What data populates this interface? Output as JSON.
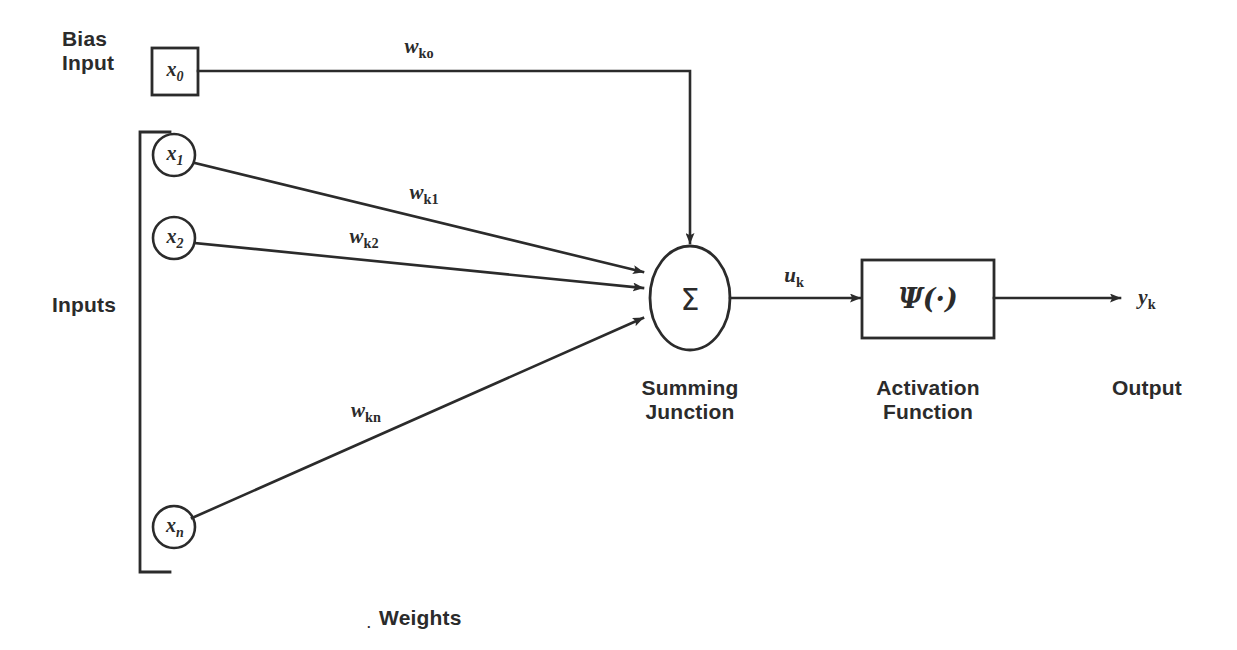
{
  "diagram": {
    "colors": {
      "ink": "#2b2b2b",
      "background": "#ffffff"
    },
    "bias": {
      "label_line1": "Bias",
      "label_line2": "Input",
      "node_symbol": "x",
      "node_subscript": "0",
      "weight_symbol": "w",
      "weight_subscript": "ko"
    },
    "inputs_label": "Inputs",
    "weights_label": "Weights",
    "weights_marker": ".",
    "nodes": [
      {
        "symbol": "x",
        "subscript": "1",
        "weight_symbol": "w",
        "weight_subscript": "k1"
      },
      {
        "symbol": "x",
        "subscript": "2",
        "weight_symbol": "w",
        "weight_subscript": "k2"
      },
      {
        "symbol": "x",
        "subscript": "n",
        "weight_symbol": "w",
        "weight_subscript": "kn"
      }
    ],
    "summing_junction": {
      "symbol": "Σ",
      "caption_line1": "Summing",
      "caption_line2": "Junction",
      "output_symbol": "u",
      "output_subscript": "k"
    },
    "activation": {
      "symbol": "Ψ(·)",
      "caption_line1": "Activation",
      "caption_line2": "Function"
    },
    "output": {
      "symbol": "y",
      "subscript": "k",
      "caption": "Output"
    }
  }
}
